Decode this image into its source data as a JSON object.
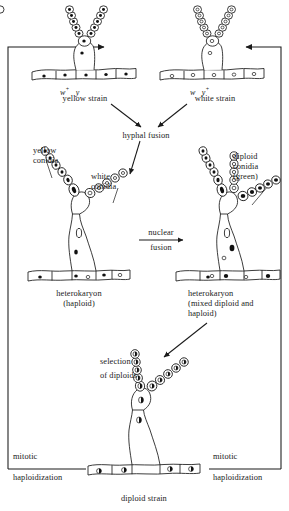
{
  "diagram": {
    "strains": {
      "yellow": {
        "genotype_w": "w",
        "genotype_w_sup": "+",
        "genotype_y": "y",
        "genotype_y_sup": "",
        "name": "yellow strain",
        "nucleus_style": "filled-dark"
      },
      "white": {
        "genotype_w": "w",
        "genotype_w_sup": "",
        "genotype_y": "y",
        "genotype_y_sup": "+",
        "name": "white strain",
        "nucleus_style": "open"
      }
    },
    "steps": {
      "hyphal_fusion": "hyphal fusion",
      "nuclear_fusion_line1": "nuclear",
      "nuclear_fusion_line2": "fusion",
      "selection_line1": "selection",
      "selection_line2": "of diploids",
      "mitotic_left_line1": "mitotic",
      "mitotic_left_line2": "haploidization",
      "mitotic_right_line1": "mitotic",
      "mitotic_right_line2": "haploidization"
    },
    "conidia": {
      "yellow_line1": "yellow",
      "yellow_line2": "conidia",
      "white_line1": "white",
      "white_line2": "conidia",
      "diploid_line1": "diploid",
      "diploid_line2": "conidia",
      "diploid_line3": "(green)"
    },
    "structures": {
      "heterokaryon_haploid_line1": "heterokaryon",
      "heterokaryon_haploid_line2": "(haploid)",
      "heterokaryon_mixed_line1": "heterokaryon",
      "heterokaryon_mixed_line2": "(mixed diploid and",
      "heterokaryon_mixed_line3": "haploid)",
      "diploid_strain": "diploid strain"
    },
    "colors": {
      "ink": "#1a1a1a",
      "background": "#ffffff",
      "nucleus_filled": "#111111",
      "nucleus_open": "#ffffff"
    }
  }
}
